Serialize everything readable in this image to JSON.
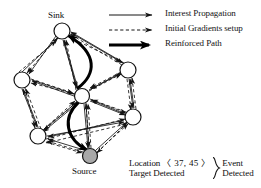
{
  "figure": {
    "type": "network-diagram"
  },
  "legend": {
    "items": [
      {
        "style": "thin-solid-arrow",
        "label": "Interest Propagation"
      },
      {
        "style": "dashed-arrow",
        "label": "Initial Gradients setup"
      },
      {
        "style": "thick-solid-arrow",
        "label": "Reinforced Path"
      }
    ]
  },
  "nodes": [
    {
      "id": "sink",
      "label": "Sink",
      "x": 62,
      "y": 31,
      "r": 8,
      "fill": "#ffffff"
    },
    {
      "id": "left",
      "label": "",
      "x": 22,
      "y": 80,
      "r": 8,
      "fill": "#ffffff"
    },
    {
      "id": "center",
      "label": "",
      "x": 82,
      "y": 96,
      "r": 7.5,
      "fill": "#ffffff"
    },
    {
      "id": "right-top",
      "label": "",
      "x": 128,
      "y": 70,
      "r": 8,
      "fill": "#ffffff"
    },
    {
      "id": "right-bottom",
      "label": "",
      "x": 133,
      "y": 117,
      "r": 8,
      "fill": "#ffffff"
    },
    {
      "id": "bottom-left",
      "label": "",
      "x": 38,
      "y": 136,
      "r": 8,
      "fill": "#ffffff"
    },
    {
      "id": "source",
      "label": "Source",
      "x": 90,
      "y": 156,
      "r": 7.5,
      "fill": "#a8a8a8"
    }
  ],
  "node_labels": [
    {
      "text": "Sink",
      "x": 48,
      "y": 12
    },
    {
      "text": "Source",
      "x": 74,
      "y": 170
    }
  ],
  "event": {
    "line1_prefix": "Location",
    "coordinates": "〈 37, 45 〉",
    "line2": "Target Detected",
    "brace_label_line1": "Event",
    "brace_label_line2": "Detected"
  },
  "colors": {
    "stroke": "#141414",
    "text": "#0d0d0d",
    "source_fill": "#a8a8a8",
    "node_fill": "#ffffff",
    "background": "#ffffff"
  }
}
